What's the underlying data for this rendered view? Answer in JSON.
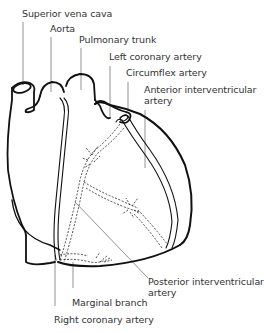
{
  "diagram": {
    "labels": {
      "superior_vena_cava": "Superior vena cava",
      "aorta": "Aorta",
      "pulmonary_trunk": "Pulmonary trunk",
      "left_coronary_artery": "Left coronary artery",
      "circumflex_artery": "Circumflex artery",
      "anterior_interventricular_line1": "Anterior interventricular",
      "anterior_interventricular_line2": "artery",
      "posterior_interventricular_line1": "Posterior interventricular",
      "posterior_interventricular_line2": "artery",
      "marginal_branch": "Marginal branch",
      "right_coronary_artery": "Right coronary artery"
    },
    "colors": {
      "outline": "#111111",
      "leader": "#666666",
      "text": "#333333",
      "background": "#ffffff"
    }
  }
}
